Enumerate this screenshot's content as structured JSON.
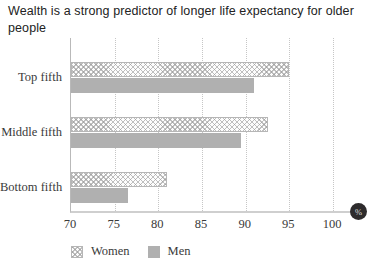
{
  "chart_data": {
    "type": "bar",
    "orientation": "horizontal",
    "title": "Wealth is a strong predictor of longer life expectancy for older people",
    "categories": [
      "Top fifth",
      "Middle fifth",
      "Bottom fifth"
    ],
    "series": [
      {
        "name": "Women",
        "style": "hatched",
        "values": [
          95,
          92.5,
          81
        ]
      },
      {
        "name": "Men",
        "style": "solid",
        "values": [
          91,
          89.5,
          76.5
        ]
      }
    ],
    "xlim": [
      70,
      100
    ],
    "xticks": [
      70,
      75,
      80,
      85,
      90,
      95,
      100
    ],
    "unit_badge": "%",
    "legend_position": "bottom-left",
    "grid": "vertical-dotted",
    "colors": {
      "men_bar": "#b0b0b0",
      "women_hatch_line": "#969696",
      "badge_bg": "#2d2b2c",
      "badge_text": "#dcdcdc",
      "grid_line": "#c6c6c6",
      "axis_line": "#cfcfcf",
      "text": "#3a3a3a",
      "title_text": "#222222"
    }
  }
}
